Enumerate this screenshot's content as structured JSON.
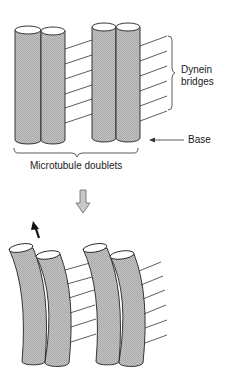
{
  "figure": {
    "labels": {
      "dynein_line1": "Dynein",
      "dynein_line2": "bridges",
      "base": "Base",
      "microtubule_doublets": "Microtubule doublets"
    },
    "icons": {
      "transition_arrow": "down-arrow-icon",
      "movement_arrow": "up-arrow-icon",
      "base_pointer": "left-arrow-icon"
    },
    "colors": {
      "tube_fill": "#bdbdbd",
      "outline": "#222222",
      "background": "#ffffff",
      "transition_arrow": "#c8c8c8",
      "movement_arrow": "#111111"
    },
    "panels": [
      {
        "state": "straight",
        "doublets": 2,
        "bridges": 6
      },
      {
        "state": "bent",
        "doublets": 2,
        "bridges": 6
      }
    ]
  }
}
